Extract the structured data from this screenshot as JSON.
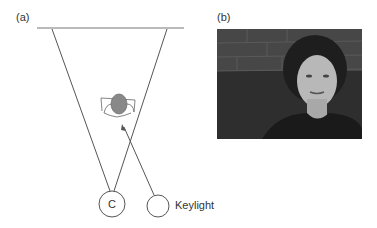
{
  "panels": {
    "a": {
      "label": "(a)",
      "camera_label": "C",
      "light_label": "Keylight"
    },
    "b": {
      "label": "(b)",
      "image_description": "photo of a woman lit by a key light in front of a brick wall"
    }
  },
  "colors": {
    "line": "#555555",
    "head_fill": "#888888",
    "background": "#ffffff"
  }
}
